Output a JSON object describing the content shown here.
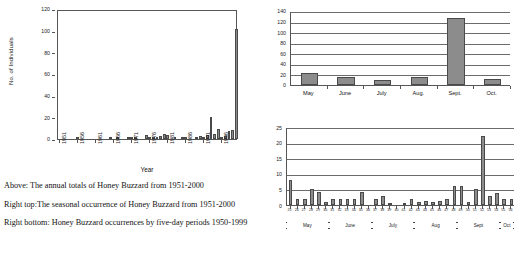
{
  "chart_data": [
    {
      "id": "annual",
      "type": "bar",
      "title": "",
      "xlabel": "Year",
      "ylabel": "No. of Individuals",
      "ylim": [
        0,
        120
      ],
      "yticks": [
        0,
        20,
        40,
        60,
        80,
        100,
        120
      ],
      "xticks": [
        "1951",
        "1956",
        "1961",
        "1966",
        "1971",
        "1976",
        "1981",
        "1986",
        "1991",
        "1996"
      ],
      "grid": false,
      "categories": [
        1951,
        1952,
        1953,
        1954,
        1955,
        1956,
        1957,
        1958,
        1959,
        1960,
        1961,
        1962,
        1963,
        1964,
        1965,
        1966,
        1967,
        1968,
        1969,
        1970,
        1971,
        1972,
        1973,
        1974,
        1975,
        1976,
        1977,
        1978,
        1979,
        1980,
        1981,
        1982,
        1983,
        1984,
        1985,
        1986,
        1987,
        1988,
        1989,
        1990,
        1991,
        1992,
        1993,
        1994,
        1995,
        1996,
        1997,
        1998,
        1999,
        2000
      ],
      "values": [
        0,
        0,
        0,
        0,
        0,
        1,
        0,
        0,
        0,
        0,
        0,
        0,
        0,
        0,
        1,
        0,
        2,
        0,
        0,
        1,
        1,
        1,
        0,
        0,
        4,
        1,
        1,
        2,
        3,
        5,
        4,
        0,
        1,
        0,
        1,
        1,
        0,
        0,
        2,
        3,
        1,
        4,
        20,
        5,
        9,
        1,
        3,
        7,
        8,
        102
      ]
    },
    {
      "id": "monthly",
      "type": "bar",
      "title": "",
      "xlabel": "",
      "ylabel": "",
      "ylim": [
        0,
        140
      ],
      "yticks": [
        0,
        20,
        40,
        60,
        80,
        100,
        120,
        140
      ],
      "grid": true,
      "categories": [
        "May",
        "June",
        "July",
        "Aug.",
        "Sept.",
        "Oct."
      ],
      "values": [
        22,
        15,
        9,
        15,
        126,
        11
      ]
    },
    {
      "id": "pentad",
      "type": "bar",
      "title": "",
      "xlabel": "",
      "ylabel": "",
      "ylim": [
        0,
        25
      ],
      "yticks": [
        0,
        5,
        10,
        15,
        20,
        25
      ],
      "grid": true,
      "categories": [
        "25",
        "26",
        "27",
        "28",
        "29",
        "30",
        "31",
        "32",
        "33",
        "34",
        "35",
        "36",
        "37",
        "38",
        "39",
        "40",
        "41",
        "42",
        "43",
        "44",
        "45",
        "46",
        "47",
        "48",
        "49",
        "50",
        "51",
        "52",
        "53",
        "54",
        "55",
        "56"
      ],
      "values": [
        8,
        2,
        2,
        5,
        4.3,
        1,
        2,
        2,
        2,
        2,
        4.3,
        0,
        2,
        3,
        0.5,
        0,
        0.2,
        2,
        1,
        1.2,
        1,
        1.2,
        2,
        6,
        6,
        1,
        5,
        22,
        3,
        4,
        2,
        2
      ],
      "month_bands": [
        {
          "label": "May",
          "start": 0,
          "end": 6
        },
        {
          "label": "June",
          "start": 6,
          "end": 12
        },
        {
          "label": "July",
          "start": 12,
          "end": 18
        },
        {
          "label": "Aug",
          "start": 18,
          "end": 24
        },
        {
          "label": "Sept",
          "start": 24,
          "end": 30
        },
        {
          "label": "Oct",
          "start": 30,
          "end": 32
        }
      ]
    }
  ],
  "captions": {
    "above": "Above: The annual totals of Honey Buzzard from 1951-2000",
    "right_top": "Right top:The seasonal occurrence of Honey Buzzard from 1951-2000",
    "right_bottom": "Right bottom: Honey Buzzard occurrences by five-day periods 1950-1999"
  },
  "colors": {
    "bar_fill": "#8c8c8c",
    "bar_stroke": "#4a4a4a",
    "axis": "#555555",
    "text": "#111111",
    "background": "#ffffff"
  }
}
